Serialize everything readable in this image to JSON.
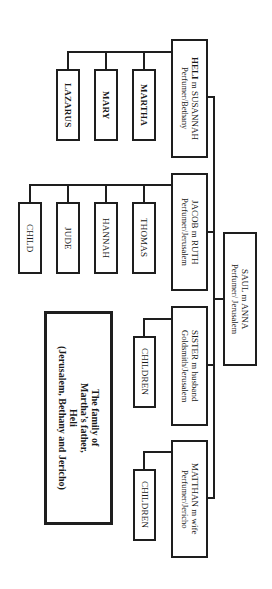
{
  "diagram": {
    "title": {
      "line1": "The family of",
      "line2": "Martha’s father,",
      "line3": "Heli",
      "line4": "(Jerusalem, Bethany and Jericho)"
    },
    "root": {
      "name": "SAUL m ANNA",
      "occupation": "Perfumer/ Jerusalem"
    },
    "branches": [
      {
        "head_bold": "HELI",
        "name_rest": " m SUSANNAH",
        "occupation": "Perfumer/Bethany",
        "children": [
          "MARTHA",
          "MARY",
          "LAZARUS"
        ]
      },
      {
        "head_bold": "",
        "name_rest": "JACOB m RUTH",
        "occupation": "Perfumer/Jerusalem",
        "children": [
          "THOMAS",
          "HANNAH",
          "JUDE",
          "CHILD"
        ]
      },
      {
        "head_bold": "",
        "name_rest": "SISTER m husband",
        "occupation": "Goldsmith/Jerusalem",
        "children": [
          "CHILDREN"
        ]
      },
      {
        "head_bold": "",
        "name_rest": "MATTHAN m wife",
        "occupation": "Perfumer/Jericho",
        "children": [
          "CHILDREN"
        ]
      }
    ],
    "colors": {
      "line": "#1e1e1e",
      "background": "#ffffff",
      "text": "#1a1a1a"
    }
  }
}
